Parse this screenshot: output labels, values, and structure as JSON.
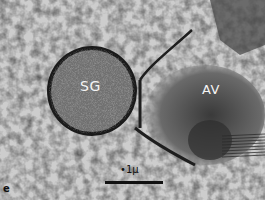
{
  "figure": {
    "panel_letter": "e",
    "labels": {
      "secretory_granule": "SG",
      "region_av": "AV"
    },
    "scale_bar": {
      "text": "•1μ",
      "value": 0.1,
      "unit": "μ"
    },
    "colors": {
      "background": "#c9c9c9",
      "granule_fill": "#6e6e6e",
      "membrane": "#1a1a1a",
      "dense_region": "#4a4a4a",
      "label_text": "#f4f4f4"
    }
  }
}
